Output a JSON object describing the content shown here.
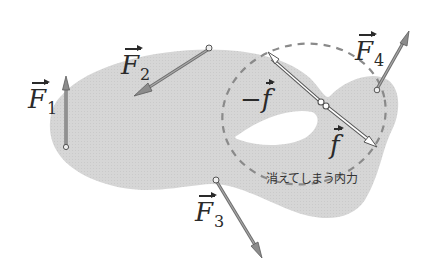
{
  "diagram": {
    "title": "",
    "body_color": "#d4d4d4",
    "arrow_color": "#7a7a7a",
    "dashed_circle_color": "#8a8a8a",
    "forces": [
      {
        "id": "F1",
        "symbol": "F",
        "subscript": "1",
        "direction": "up"
      },
      {
        "id": "F2",
        "symbol": "F",
        "subscript": "2",
        "direction": "down-left"
      },
      {
        "id": "F3",
        "symbol": "F",
        "subscript": "3",
        "direction": "down-right"
      },
      {
        "id": "F4",
        "symbol": "F",
        "subscript": "4",
        "direction": "up-right"
      }
    ],
    "internal_forces": [
      {
        "id": "neg_f",
        "prefix": "−",
        "symbol": "f",
        "direction": "up-left"
      },
      {
        "id": "f",
        "prefix": "",
        "symbol": "f",
        "direction": "down-right"
      }
    ],
    "caption": "消えてしまう内力"
  }
}
